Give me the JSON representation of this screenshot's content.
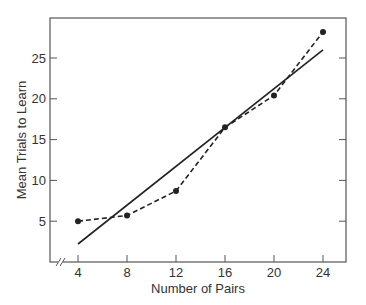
{
  "chart_data": {
    "type": "line",
    "title": "",
    "xlabel": "Number of Pairs",
    "ylabel": "Mean Trials to Learn",
    "x": [
      4,
      8,
      12,
      16,
      20,
      24
    ],
    "xticks": [
      "4",
      "8",
      "12",
      "16",
      "20",
      "24"
    ],
    "yticks": [
      "5",
      "10",
      "15",
      "20",
      "25"
    ],
    "xlim": [
      1.7,
      25.8
    ],
    "ylim": [
      0,
      30
    ],
    "grid": false,
    "axis_break_x": true,
    "series": [
      {
        "name": "Observed",
        "style": "dashed",
        "marker": "circle",
        "values": [
          5.0,
          5.7,
          8.7,
          16.5,
          20.4,
          28.2
        ]
      },
      {
        "name": "Linear fit",
        "style": "solid",
        "marker": "none",
        "x": [
          4,
          24
        ],
        "values": [
          2.2,
          26.0
        ]
      }
    ],
    "colors": {
      "line": "#222222",
      "axis": "#555555",
      "text": "#333333"
    }
  }
}
